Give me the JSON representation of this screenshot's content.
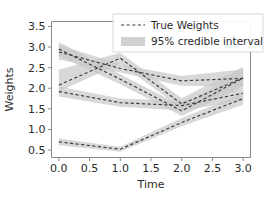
{
  "chart_data": {
    "type": "line",
    "title": "",
    "xlabel": "Time",
    "ylabel": "Weights",
    "xlim": [
      -0.12,
      3.12
    ],
    "ylim": [
      0.32,
      3.62
    ],
    "xticks": [
      0.0,
      0.5,
      1.0,
      1.5,
      2.0,
      2.5,
      3.0
    ],
    "xtick_labels": [
      "0.0",
      "0.5",
      "1.0",
      "1.5",
      "2.0",
      "2.5",
      "3.0"
    ],
    "yticks": [
      0.5,
      1.0,
      1.5,
      2.0,
      2.5,
      3.0,
      3.5
    ],
    "ytick_labels": [
      "0.5",
      "1.0",
      "1.5",
      "2.0",
      "2.5",
      "3.0",
      "3.5"
    ],
    "grid": false,
    "x": [
      0.0,
      1.0,
      2.0,
      3.0
    ],
    "series": [
      {
        "name": "weight-1",
        "values": [
          2.95,
          2.22,
          1.45,
          2.25
        ],
        "ci_lower": [
          2.78,
          2.1,
          1.33,
          2.03
        ],
        "ci_upper": [
          3.12,
          2.34,
          1.57,
          2.47
        ]
      },
      {
        "name": "weight-2",
        "values": [
          2.08,
          2.73,
          1.62,
          2.25
        ],
        "ci_lower": [
          1.92,
          2.6,
          1.5,
          2.05
        ],
        "ci_upper": [
          2.45,
          2.86,
          1.76,
          2.52
        ]
      },
      {
        "name": "weight-3",
        "values": [
          2.88,
          2.48,
          2.18,
          2.24
        ],
        "ci_lower": [
          2.7,
          2.38,
          2.06,
          2.04
        ],
        "ci_upper": [
          3.05,
          2.58,
          2.3,
          2.46
        ]
      },
      {
        "name": "weight-4",
        "values": [
          1.92,
          1.65,
          1.58,
          1.88
        ],
        "ci_lower": [
          1.8,
          1.55,
          1.46,
          1.7
        ],
        "ci_upper": [
          2.04,
          1.75,
          1.7,
          2.02
        ]
      },
      {
        "name": "weight-5",
        "values": [
          0.7,
          0.52,
          1.17,
          1.75
        ],
        "ci_lower": [
          0.62,
          0.46,
          1.08,
          1.6
        ],
        "ci_upper": [
          0.78,
          0.58,
          1.28,
          1.88
        ]
      }
    ],
    "legend": {
      "position": "upper center",
      "entries": [
        {
          "label": "True Weights",
          "marker": "dashed-line",
          "color": "#3a3a3a"
        },
        {
          "label": "95% credible interval",
          "marker": "shaded-band",
          "color": "#c9c9c9"
        }
      ]
    },
    "colors": {
      "line": "#3a3a3a",
      "band": "#c9c9c9",
      "axis": "#8a8a8a",
      "text": "#2b2b2b",
      "background": "#ffffff"
    }
  }
}
